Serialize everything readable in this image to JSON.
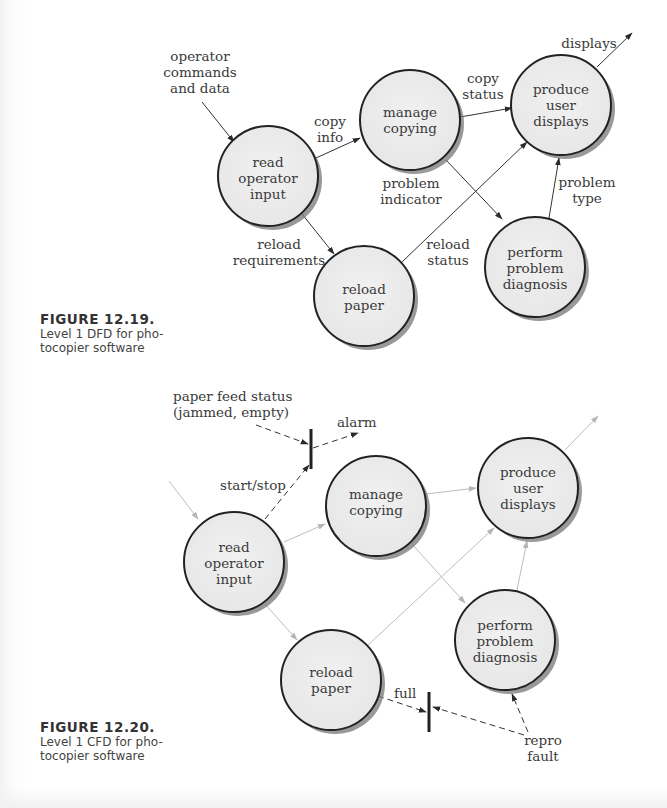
{
  "figures": [
    {
      "id": "dfd",
      "caption": {
        "number": "FIGURE 12.19.",
        "line1": "Level 1 DFD for pho-",
        "line2": "tocopier software"
      },
      "processes": [
        {
          "key": "read",
          "lines": [
            "read",
            "operator",
            "input"
          ]
        },
        {
          "key": "manage",
          "lines": [
            "manage",
            "copying"
          ]
        },
        {
          "key": "produce",
          "lines": [
            "produce",
            "user",
            "displays"
          ]
        },
        {
          "key": "diagnose",
          "lines": [
            "perform",
            "problem",
            "diagnosis"
          ]
        },
        {
          "key": "reload",
          "lines": [
            "reload",
            "paper"
          ]
        }
      ],
      "flow_labels": {
        "operator_commands": [
          "operator",
          "commands",
          "and data"
        ],
        "copy_info": [
          "copy",
          "info"
        ],
        "copy_status": [
          "copy",
          "status"
        ],
        "displays": [
          "displays"
        ],
        "problem_indicator": [
          "problem",
          "indicator"
        ],
        "problem_type": [
          "problem",
          "type"
        ],
        "reload_requirements": [
          "reload",
          "requirements"
        ],
        "reload_status": [
          "reload",
          "status"
        ]
      }
    },
    {
      "id": "cfd",
      "caption": {
        "number": "FIGURE 12.20.",
        "line1": "Level 1 CFD for pho-",
        "line2": "tocopier software"
      },
      "processes": [
        {
          "key": "read",
          "lines": [
            "read",
            "operator",
            "input"
          ]
        },
        {
          "key": "manage",
          "lines": [
            "manage",
            "copying"
          ]
        },
        {
          "key": "produce",
          "lines": [
            "produce",
            "user",
            "displays"
          ]
        },
        {
          "key": "diagnose",
          "lines": [
            "perform",
            "problem",
            "diagnosis"
          ]
        },
        {
          "key": "reload",
          "lines": [
            "reload",
            "paper"
          ]
        }
      ],
      "control_labels": {
        "paper_feed_status": [
          "paper feed status",
          "(jammed, empty)"
        ],
        "alarm": [
          "alarm"
        ],
        "start_stop": [
          "start/stop"
        ],
        "full": [
          "full"
        ],
        "repro_fault": [
          "repro",
          "fault"
        ]
      }
    }
  ]
}
